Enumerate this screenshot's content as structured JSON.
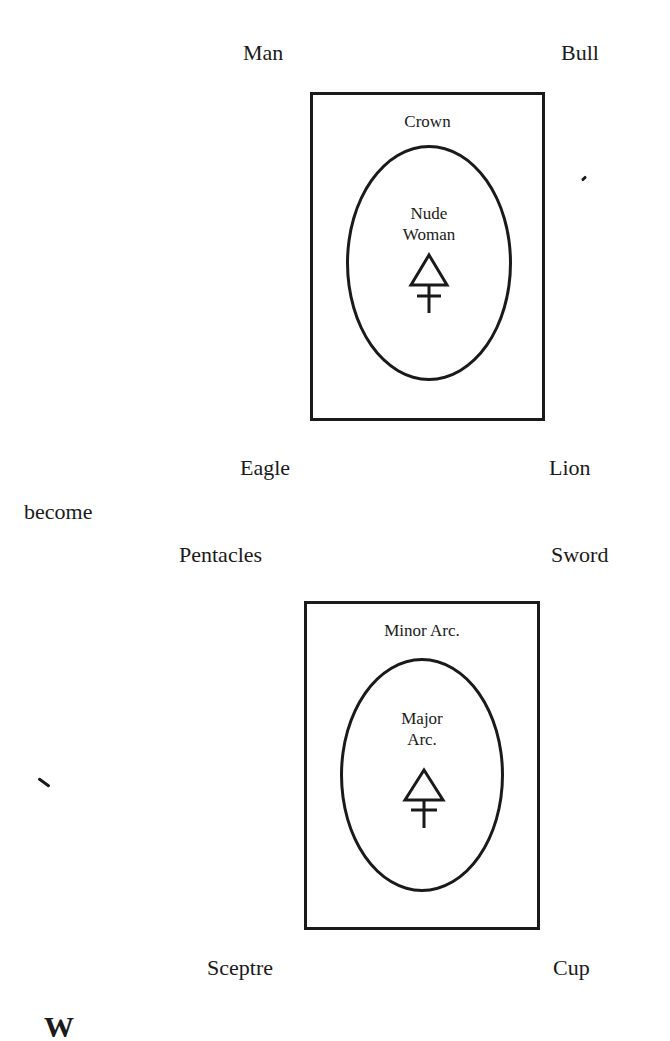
{
  "diagram_top": {
    "corners": {
      "top_left": "Man",
      "top_right": "Bull",
      "bottom_left": "Eagle",
      "bottom_right": "Lion"
    },
    "card_header": "Crown",
    "oval_text_line1": "Nude",
    "oval_text_line2": "Woman",
    "symbol": "sulphur-triangle-cross"
  },
  "connector_text": "become",
  "diagram_bottom": {
    "corners": {
      "top_left": "Pentacles",
      "top_right": "Sword",
      "bottom_left": "Sceptre",
      "bottom_right": "Cup"
    },
    "card_header": "Minor Arc.",
    "oval_text_line1": "Major",
    "oval_text_line2": "Arc.",
    "symbol": "sulphur-triangle-cross"
  },
  "footer_partial_text": "W"
}
